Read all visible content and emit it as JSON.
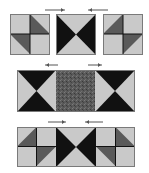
{
  "diagram": {
    "colors": {
      "light": "#c9c9c9",
      "print": "#5a5a5a",
      "dark": "#111111",
      "border": "#7a7a7a",
      "arrow": "#555555",
      "background": "#ffffff"
    },
    "rows": [
      {
        "blocks": [
          "pinwheel-a",
          "bowtie-vertical",
          "pinwheel-b"
        ],
        "arrows": [
          "right",
          "left"
        ]
      },
      {
        "blocks": [
          "hourglass",
          "print-rectangle",
          "hourglass"
        ],
        "arrows": [
          "left",
          "right"
        ]
      },
      {
        "blocks": [
          "pinwheel-b",
          "bowtie-vertical",
          "pinwheel-a"
        ],
        "arrows": [
          "right",
          "left"
        ]
      }
    ]
  }
}
